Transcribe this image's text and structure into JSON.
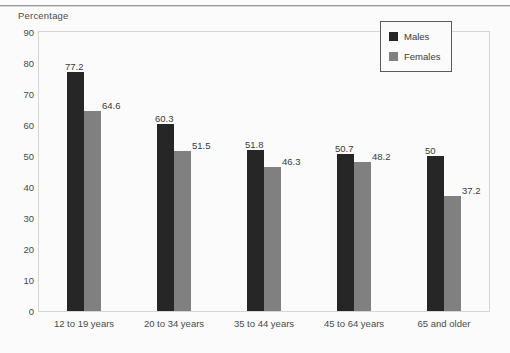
{
  "chart_data": {
    "type": "bar",
    "title": "",
    "subtitle": "",
    "xlabel": "",
    "ylabel": "Percentage",
    "ylim": [
      0,
      90
    ],
    "yticks": [
      90,
      80,
      70,
      60,
      50,
      40,
      30,
      20,
      10,
      0
    ],
    "grid": false,
    "legend_position": "top-right",
    "categories": [
      "12 to 19 years",
      "20 to 34 years",
      "35 to 44 years",
      "45 to 64 years",
      "65 and older"
    ],
    "series": [
      {
        "name": "Males",
        "color": "#262626",
        "values": [
          77.2,
          60.3,
          51.8,
          50.7,
          50
        ],
        "labels": [
          "77.2",
          "60.3",
          "51.8",
          "50.7",
          "50"
        ]
      },
      {
        "name": "Females",
        "color": "#808080",
        "values": [
          64.6,
          51.5,
          46.3,
          48.2,
          37.2
        ],
        "labels": [
          "64.6",
          "51.5",
          "46.3",
          "48.2",
          "37.2"
        ]
      }
    ]
  },
  "legend": {
    "items": [
      {
        "label": "Males",
        "swatch": "males"
      },
      {
        "label": "Females",
        "swatch": "females"
      }
    ]
  },
  "colors": {
    "males": "#262626",
    "females": "#808080",
    "frame": "#d6d6d6",
    "text": "#4a4a4a",
    "background": "#fbfbfb"
  }
}
